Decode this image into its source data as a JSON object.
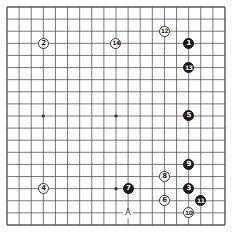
{
  "diagram": {
    "type": "go-board",
    "size": 19,
    "colors": {
      "line": "#555555",
      "black": "#1a1a1a",
      "white": "#ffffff"
    },
    "star_points": [
      [
        3,
        3
      ],
      [
        3,
        9
      ],
      [
        3,
        15
      ],
      [
        9,
        3
      ],
      [
        9,
        9
      ],
      [
        9,
        15
      ],
      [
        15,
        3
      ],
      [
        15,
        9
      ],
      [
        15,
        15
      ]
    ],
    "stones": [
      {
        "move": "1",
        "color": "black",
        "col": 15,
        "row": 3
      },
      {
        "move": "2",
        "color": "white",
        "col": 3,
        "row": 3
      },
      {
        "move": "3",
        "color": "black",
        "col": 15,
        "row": 15
      },
      {
        "move": "4",
        "color": "white",
        "col": 3,
        "row": 15
      },
      {
        "move": "5",
        "color": "black",
        "col": 15,
        "row": 9
      },
      {
        "move": "6",
        "color": "white",
        "col": 13,
        "row": 16
      },
      {
        "move": "7",
        "color": "black",
        "col": 10,
        "row": 15
      },
      {
        "move": "8",
        "color": "white",
        "col": 13,
        "row": 14
      },
      {
        "move": "9",
        "color": "black",
        "col": 15,
        "row": 13
      },
      {
        "move": "10",
        "color": "white",
        "col": 15,
        "row": 17
      },
      {
        "move": "11",
        "color": "black",
        "col": 16,
        "row": 16
      },
      {
        "move": "12",
        "color": "white",
        "col": 13,
        "row": 2
      },
      {
        "move": "13",
        "color": "black",
        "col": 15,
        "row": 5
      },
      {
        "move": "14",
        "color": "white",
        "col": 9,
        "row": 3
      }
    ],
    "labels": [
      {
        "text": "A",
        "col": 10,
        "row": 17
      }
    ]
  }
}
